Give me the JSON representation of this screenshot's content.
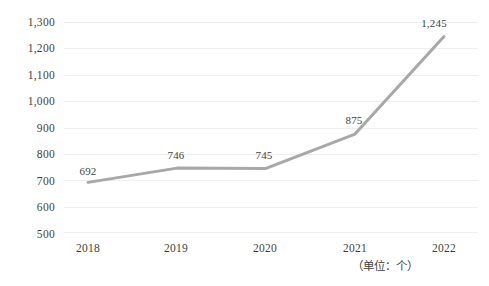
{
  "chart_data": {
    "type": "line",
    "title": "",
    "subtitle": "",
    "xlabel": "",
    "ylabel": "",
    "categories": [
      "2018",
      "2019",
      "2020",
      "2021",
      "2022"
    ],
    "values": [
      692,
      746,
      745,
      875,
      1245
    ],
    "point_labels": [
      "692",
      "746",
      "745",
      "875",
      "1,245"
    ],
    "series": [
      {
        "name": "",
        "values": [
          692,
          746,
          745,
          875,
          1245
        ]
      }
    ],
    "ylim": [
      500,
      1300
    ],
    "ytick_step": 100,
    "ytick_labels": [
      "1,300",
      "1,200",
      "1,100",
      "1,000",
      "900",
      "800",
      "700",
      "600",
      "500"
    ],
    "ytick_values": [
      1300,
      1200,
      1100,
      1000,
      900,
      800,
      700,
      600,
      500
    ],
    "xtick_labels": [
      "2018",
      "2019",
      "2020",
      "2021",
      "2022"
    ],
    "grid": true,
    "grid_axis": "y",
    "legend": false,
    "legend_position": "none",
    "annotation": "（单位：个）",
    "colors": {
      "line": "#a8a8a8",
      "grid": "#eceef0",
      "text": "#3f3f3f",
      "background": "#ffffff"
    }
  }
}
